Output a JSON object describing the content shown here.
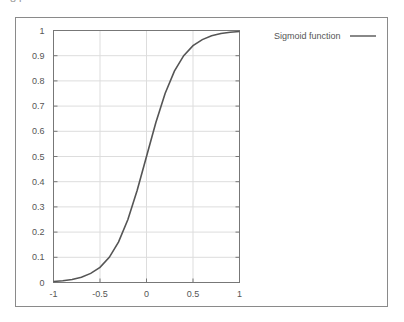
{
  "page": {
    "number_fragment": "84"
  },
  "chart_data": {
    "type": "line",
    "title": "",
    "xlabel": "",
    "ylabel": "",
    "xlim": [
      -1,
      1
    ],
    "ylim": [
      0,
      1
    ],
    "grid": true,
    "legend_position": "outside-right-top",
    "x_ticks": [
      "-1",
      "-0.5",
      "0",
      "0.5",
      "1"
    ],
    "y_ticks": [
      "0",
      "0.1",
      "0.2",
      "0.3",
      "0.4",
      "0.5",
      "0.6",
      "0.7",
      "0.8",
      "0.9",
      "1"
    ],
    "series": [
      {
        "name": "Sigmoid function",
        "color": "#555555",
        "x": [
          -1.0,
          -0.9,
          -0.8,
          -0.7,
          -0.6,
          -0.5,
          -0.4,
          -0.3,
          -0.2,
          -0.1,
          0.0,
          0.1,
          0.2,
          0.3,
          0.4,
          0.5,
          0.6,
          0.7,
          0.8,
          0.9,
          1.0
        ],
        "y": [
          0.004,
          0.007,
          0.012,
          0.021,
          0.036,
          0.06,
          0.1,
          0.161,
          0.25,
          0.366,
          0.5,
          0.634,
          0.75,
          0.839,
          0.9,
          0.94,
          0.964,
          0.979,
          0.988,
          0.993,
          0.996
        ]
      }
    ]
  },
  "colors": {
    "frame": "#8a8a8a",
    "grid": "#dddddd",
    "axis": "#777777",
    "text": "#555555"
  }
}
